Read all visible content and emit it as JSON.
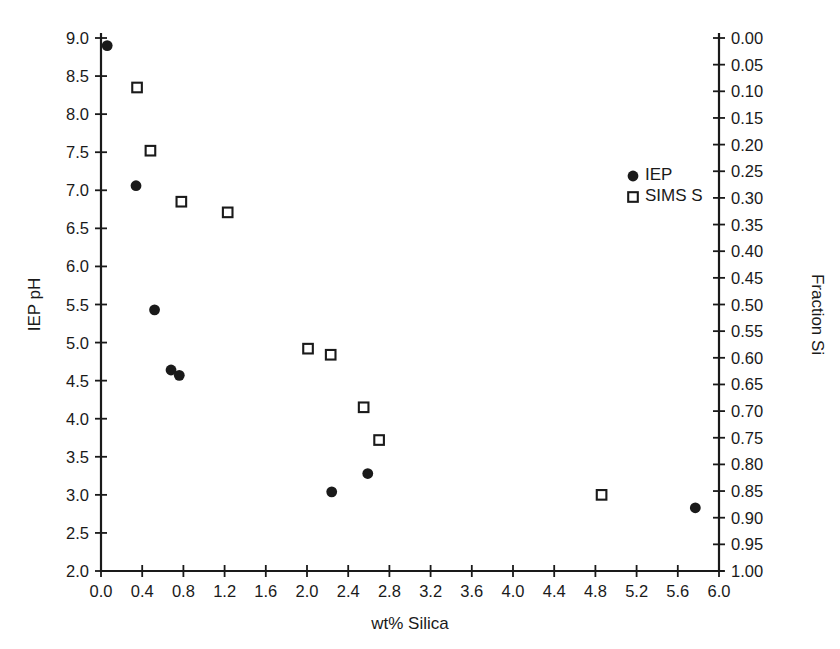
{
  "chart_data": {
    "type": "scatter",
    "title": "",
    "xlabel": "wt% Silica",
    "ylabel": "IEP pH",
    "y2label": "Fraction Si",
    "xlim": [
      0.0,
      6.0
    ],
    "ylim": [
      2.0,
      9.0
    ],
    "y2lim": [
      0.0,
      1.0
    ],
    "y2_inverted": true,
    "grid": false,
    "legend_position": "upper right",
    "xticks": [
      "0.0",
      "0.4",
      "0.8",
      "1.2",
      "1.6",
      "2.0",
      "2.4",
      "2.8",
      "3.2",
      "3.6",
      "4.0",
      "4.4",
      "4.8",
      "5.2",
      "5.6",
      "6.0"
    ],
    "xtick_values": [
      0.0,
      0.4,
      0.8,
      1.2,
      1.6,
      2.0,
      2.4,
      2.8,
      3.2,
      3.6,
      4.0,
      4.4,
      4.8,
      5.2,
      5.6,
      6.0
    ],
    "yticks": [
      "2.0",
      "2.5",
      "3.0",
      "3.5",
      "4.0",
      "4.5",
      "5.0",
      "5.5",
      "6.0",
      "6.5",
      "7.0",
      "7.5",
      "8.0",
      "8.5",
      "9.0"
    ],
    "ytick_values": [
      2.0,
      2.5,
      3.0,
      3.5,
      4.0,
      4.5,
      5.0,
      5.5,
      6.0,
      6.5,
      7.0,
      7.5,
      8.0,
      8.5,
      9.0
    ],
    "y2ticks": [
      "0.00",
      "0.05",
      "0.10",
      "0.15",
      "0.20",
      "0.25",
      "0.30",
      "0.35",
      "0.40",
      "0.45",
      "0.50",
      "0.55",
      "0.60",
      "0.65",
      "0.70",
      "0.75",
      "0.80",
      "0.85",
      "0.90",
      "0.95",
      "1.00"
    ],
    "y2tick_values": [
      0.0,
      0.05,
      0.1,
      0.15,
      0.2,
      0.25,
      0.3,
      0.35,
      0.4,
      0.45,
      0.5,
      0.55,
      0.6,
      0.65,
      0.7,
      0.75,
      0.8,
      0.85,
      0.9,
      0.95,
      1.0
    ],
    "series": [
      {
        "name": "IEP",
        "marker": "filled-circle",
        "color": "#1a1a1a",
        "axis": "left",
        "points": [
          {
            "x": 0.06,
            "y": 8.9
          },
          {
            "x": 0.34,
            "y": 7.06
          },
          {
            "x": 0.52,
            "y": 5.43
          },
          {
            "x": 0.68,
            "y": 4.64
          },
          {
            "x": 0.76,
            "y": 4.57
          },
          {
            "x": 2.24,
            "y": 3.04
          },
          {
            "x": 2.59,
            "y": 3.28
          },
          {
            "x": 5.77,
            "y": 2.83
          }
        ]
      },
      {
        "name": "SIMS S",
        "marker": "open-square",
        "color": "#1a1a1a",
        "axis": "left",
        "points": [
          {
            "x": 0.35,
            "y": 8.35
          },
          {
            "x": 0.48,
            "y": 7.52
          },
          {
            "x": 0.78,
            "y": 6.85
          },
          {
            "x": 1.23,
            "y": 6.71
          },
          {
            "x": 2.01,
            "y": 4.92
          },
          {
            "x": 2.23,
            "y": 4.84
          },
          {
            "x": 2.55,
            "y": 4.15
          },
          {
            "x": 2.7,
            "y": 3.72
          },
          {
            "x": 4.86,
            "y": 3.0
          }
        ]
      }
    ],
    "legend": [
      {
        "label": "IEP",
        "marker": "filled-circle"
      },
      {
        "label": "SIMS S",
        "marker": "open-square"
      }
    ]
  }
}
